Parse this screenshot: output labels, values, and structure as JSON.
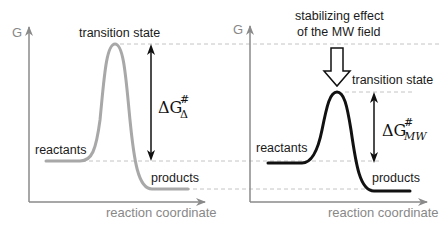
{
  "left_panel": {
    "y_axis_label": "G",
    "x_axis_label": "reaction coordinate",
    "transition_label": "transition state",
    "reactants_label": "reactants",
    "products_label": "products",
    "delta_g": {
      "main": "ΔG",
      "superscript": "#",
      "subscript": "Δ"
    },
    "curve_color": "#a8a8a8"
  },
  "right_panel": {
    "y_axis_label": "G",
    "x_axis_label": "reaction coordinate",
    "annotation_line1": "stabilizing effect",
    "annotation_line2": "of the MW field",
    "transition_label": "transition state",
    "reactants_label": "reactants",
    "products_label": "products",
    "delta_g": {
      "main": "ΔG",
      "superscript": "#",
      "subscript": "MW"
    },
    "curve_color": "#111111"
  },
  "colors": {
    "axis": "#8a8a8a",
    "dashed": "#bdbdbd",
    "arrow": "#111111"
  }
}
